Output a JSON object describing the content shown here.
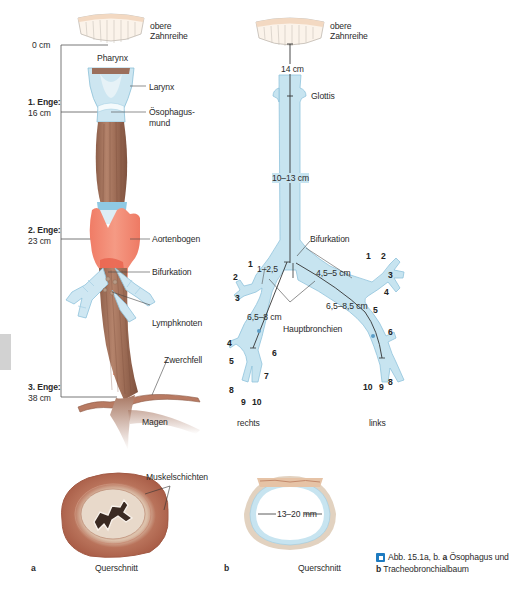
{
  "figure": {
    "caption_icon": "figure-icon",
    "caption_line1_prefix": "Abb. 15.1a, b.",
    "caption_line1_bold": "a",
    "caption_line1_rest": "Ösophagus und",
    "caption_line2_bold": "b",
    "caption_line2_rest": "Tracheobronchialbaum",
    "colors": {
      "esophagus_muscle": "#a8765e",
      "aorta": "#f08a74",
      "airway": "#c5e3ef",
      "airway_edge": "#8fc3dc",
      "teeth": "#f6e2cf",
      "lines": "#3a3a3a"
    }
  },
  "panel_a": {
    "letter": "a",
    "teeth_label_1": "obere",
    "teeth_label_2": "Zahnreihe",
    "zero": "0 cm",
    "pharynx": "Pharynx",
    "larynx": "Larynx",
    "oesophagus_mouth_1": "Ösophagus-",
    "oesophagus_mouth_2": "mund",
    "narrowings": [
      {
        "title": "1. Enge:",
        "value": "16 cm"
      },
      {
        "title": "2. Enge:",
        "value": "23 cm"
      },
      {
        "title": "3. Enge:",
        "value": "38 cm"
      }
    ],
    "aortic_arch": "Aortenbogen",
    "bifurcation": "Bifurkation",
    "lymph_nodes": "Lymphknoten",
    "diaphragm": "Zwerchfell",
    "stomach": "Magen",
    "cross_section_title": "Querschnitt",
    "muscle_layers": "Muskelschichten"
  },
  "panel_b": {
    "letter": "b",
    "teeth_label_1": "obere",
    "teeth_label_2": "Zahnreihe",
    "dist_teeth_glottis": "14 cm",
    "glottis": "Glottis",
    "trachea_length": "10–13 cm",
    "bifurcation": "Bifurkation",
    "right_upper_lobe_dist": "1–2,5",
    "left_main_upper": "4,5–5 cm",
    "right_main": "6,5–8 cm",
    "left_main": "6,5–8,5 cm",
    "main_bronchi": "Hauptbronchien",
    "right": "rechts",
    "left": "links",
    "right_segments": [
      "1",
      "2",
      "3",
      "4",
      "5",
      "6",
      "7",
      "8",
      "9",
      "10"
    ],
    "left_segments": [
      "1",
      "2",
      "3",
      "4",
      "5",
      "6",
      "8",
      "9",
      "10"
    ],
    "cross_section_title": "Querschnitt",
    "diameter": "13–20 mm"
  }
}
